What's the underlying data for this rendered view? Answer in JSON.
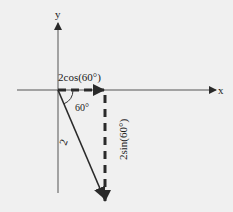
{
  "diagram": {
    "type": "vector-decomposition",
    "axes": {
      "x_label": "x",
      "y_label": "y"
    },
    "vector": {
      "magnitude_label": "2",
      "angle_label": "60°",
      "direction": "below positive x-axis"
    },
    "components": {
      "horizontal_label": "2cos(60°)",
      "vertical_label": "2sin(60°)",
      "style": "dashed"
    },
    "colors": {
      "background": "#f0f0f0",
      "stroke": "#2a2a2a",
      "axis": "#444444"
    }
  }
}
